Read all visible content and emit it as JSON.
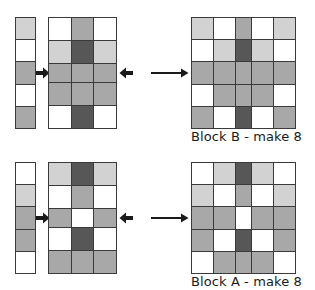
{
  "diagram": {
    "palette": {
      "white": "#ffffff",
      "light": "#d2d2d2",
      "medium": "#a8a8a8",
      "dark": "#575757",
      "seam_line": "#3a3a3a",
      "text": "#1a1a1a"
    },
    "icons": {
      "arrow_right": "arrow-right-icon",
      "arrow_left": "arrow-left-icon"
    },
    "assemblies": [
      {
        "id": "block-b",
        "caption": "Block B - make 8",
        "left_strip": {
          "name": "left-side-strip",
          "columns": 1,
          "rows": 5,
          "cells": [
            "light",
            "white",
            "medium",
            "white",
            "medium"
          ]
        },
        "center_unit": {
          "name": "center-unit",
          "columns": 3,
          "rows": 5,
          "cells": [
            [
              "white",
              "medium",
              "white"
            ],
            [
              "light",
              "dark",
              "light"
            ],
            [
              "medium",
              "medium",
              "medium"
            ],
            [
              "medium",
              "medium",
              "medium"
            ],
            [
              "white",
              "dark",
              "white"
            ]
          ]
        },
        "right_strip": {
          "name": "right-side-strip",
          "columns": 1,
          "rows": 5,
          "cells": [
            "light",
            "white",
            "medium",
            "white",
            "medium"
          ]
        },
        "finished_block": {
          "name": "finished-block-b",
          "columns": 5,
          "rows": 5,
          "cells": [
            [
              "light",
              "white",
              "medium",
              "white",
              "light"
            ],
            [
              "white",
              "light",
              "dark",
              "light",
              "white"
            ],
            [
              "medium",
              "medium",
              "medium",
              "medium",
              "medium"
            ],
            [
              "white",
              "medium",
              "medium",
              "medium",
              "white"
            ],
            [
              "medium",
              "white",
              "dark",
              "white",
              "medium"
            ]
          ]
        }
      },
      {
        "id": "block-a",
        "caption": "Block A - make 8",
        "left_strip": {
          "name": "left-side-strip",
          "columns": 1,
          "rows": 5,
          "cells": [
            "white",
            "light",
            "medium",
            "medium",
            "white"
          ]
        },
        "center_unit": {
          "name": "center-unit",
          "columns": 3,
          "rows": 5,
          "cells": [
            [
              "light",
              "dark",
              "light"
            ],
            [
              "white",
              "medium",
              "white"
            ],
            [
              "medium",
              "white",
              "medium"
            ],
            [
              "white",
              "dark",
              "white"
            ],
            [
              "medium",
              "medium",
              "medium"
            ]
          ]
        },
        "right_strip": {
          "name": "right-side-strip",
          "columns": 1,
          "rows": 5,
          "cells": [
            "white",
            "light",
            "medium",
            "medium",
            "white"
          ]
        },
        "finished_block": {
          "name": "finished-block-a",
          "columns": 5,
          "rows": 5,
          "cells": [
            [
              "white",
              "light",
              "dark",
              "light",
              "white"
            ],
            [
              "light",
              "white",
              "medium",
              "white",
              "light"
            ],
            [
              "medium",
              "medium",
              "white",
              "medium",
              "medium"
            ],
            [
              "medium",
              "white",
              "dark",
              "white",
              "medium"
            ],
            [
              "white",
              "medium",
              "medium",
              "medium",
              "white"
            ]
          ]
        }
      }
    ]
  }
}
